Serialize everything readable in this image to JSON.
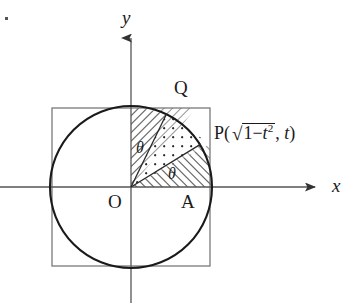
{
  "figure": {
    "title_mark": "·",
    "axes": {
      "x_label": "x",
      "y_label": "y"
    },
    "points": {
      "origin": "O",
      "a": "A",
      "q": "Q",
      "p_prefix": "P(",
      "p_radical": "√",
      "p_radicand_one": "1",
      "p_radicand_minus": "−",
      "p_radicand_t": "t",
      "p_radicand_exp": "2",
      "p_comma": ",",
      "p_second": "t",
      "p_suffix": ")"
    },
    "angles": {
      "upper_theta": "θ",
      "lower_theta": "θ"
    },
    "geometry": {
      "origin_x": 131,
      "origin_y": 187,
      "circle_radius": 81,
      "square_half": 79,
      "q_angle_deg": 64,
      "p_angle_deg": 32,
      "circle_color": "#1a1a1a",
      "square_color": "#6e6e6e",
      "axis_color": "#555555",
      "hatch_color": "#3a3a3a",
      "dot_color": "#2a2a2a"
    }
  }
}
